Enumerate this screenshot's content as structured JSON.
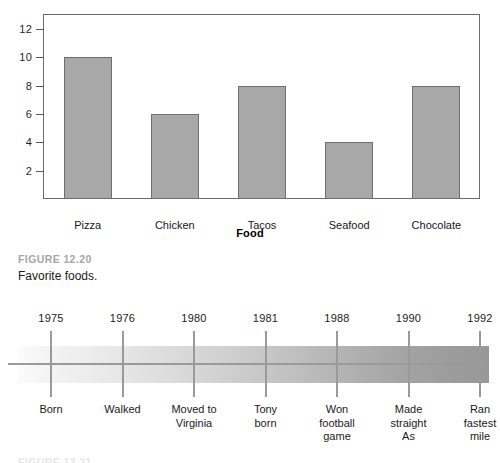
{
  "chart_data": {
    "type": "bar",
    "title": "",
    "xlabel": "Food",
    "ylabel": "",
    "categories": [
      "Pizza",
      "Chicken",
      "Tacos",
      "Seafood",
      "Chocolate"
    ],
    "values": [
      10,
      6,
      8,
      4,
      8
    ],
    "ylim": [
      0,
      13
    ],
    "yticks": [
      2,
      4,
      6,
      8,
      10,
      12
    ],
    "ytick_labels": [
      "2",
      "4",
      "6",
      "8",
      "10",
      "12"
    ],
    "grid": false,
    "legend": false,
    "bar_color": "#a8a8a8",
    "bar_border_color": "#6f6f6f",
    "axis_color": "#6b6b6b"
  },
  "bar_figure": {
    "axis_title": "Food"
  },
  "caption_1": {
    "figure_number": "FIGURE 12.20",
    "title": "Favorite foods.",
    "number_color": "#a6a6a6"
  },
  "timeline": {
    "band_start_color": "#fbfbfb",
    "band_end_color": "#989898",
    "line_color": "#9a9a9a",
    "events": [
      {
        "year": "1975",
        "label": "Born"
      },
      {
        "year": "1976",
        "label": "Walked"
      },
      {
        "year": "1980",
        "label": "Moved to\nVirginia"
      },
      {
        "year": "1981",
        "label": "Tony\nborn"
      },
      {
        "year": "1988",
        "label": "Won\nfootball\ngame"
      },
      {
        "year": "1990",
        "label": "Made\nstraight\nAs"
      },
      {
        "year": "1992",
        "label": "Ran\nfastest\nmile"
      }
    ]
  },
  "caption_2": {
    "figure_number": "FIGURE 12.21"
  }
}
